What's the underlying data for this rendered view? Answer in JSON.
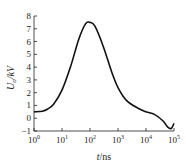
{
  "chart_data": {
    "type": "line",
    "title": "",
    "xlabel": "t/ns",
    "ylabel": "U_o/kV",
    "xscale": "log",
    "xlim": [
      1,
      100000
    ],
    "ylim": [
      -1,
      8
    ],
    "grid": false,
    "x_tick_labels": [
      "10^0",
      "10^1",
      "10^2",
      "10^3",
      "10^4",
      "10^5"
    ],
    "y_tick_labels": [
      "-1",
      "0",
      "1",
      "2",
      "3",
      "4",
      "5",
      "6",
      "7",
      "8"
    ],
    "series": [
      {
        "name": "U_o",
        "x": [
          1,
          2,
          3,
          5,
          10,
          20,
          40,
          70,
          100,
          150,
          300,
          600,
          1000,
          2000,
          5000,
          10000,
          20000,
          40000,
          60000,
          80000,
          100000
        ],
        "y": [
          0.5,
          0.55,
          0.7,
          1.1,
          2.2,
          4.0,
          6.2,
          7.4,
          7.5,
          7.2,
          5.6,
          3.6,
          2.4,
          1.4,
          0.8,
          0.5,
          0.3,
          -0.2,
          -0.7,
          -0.8,
          -0.4
        ]
      }
    ]
  }
}
